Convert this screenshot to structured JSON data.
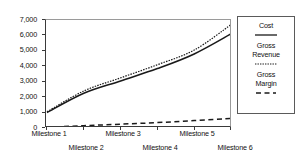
{
  "chart_data": {
    "type": "line",
    "title": "",
    "xlabel": "",
    "ylabel": "",
    "categories": [
      "Milestone 1",
      "Milestone 2",
      "Milestone 3",
      "Milestone 4",
      "Milestone 5",
      "Milestone 6"
    ],
    "x": [
      1,
      2,
      3,
      4,
      5,
      6
    ],
    "ylim": [
      0,
      7000
    ],
    "yticks": [
      0,
      1000,
      2000,
      3000,
      4000,
      5000,
      6000,
      7000
    ],
    "ytick_labels": [
      "0",
      "1,000",
      "2,000",
      "3,000",
      "4,000",
      "5,000",
      "6,000",
      "7,000"
    ],
    "grid": false,
    "legend_position": "right",
    "series": [
      {
        "name": "Cost",
        "style": "solid",
        "color": "#1a1a1a",
        "values": [
          1000,
          2250,
          3050,
          3850,
          4800,
          6100
        ]
      },
      {
        "name": "Gross Revenue",
        "style": "dotted",
        "color": "#1a1a1a",
        "values": [
          1050,
          2400,
          3250,
          4100,
          5050,
          6700
        ]
      },
      {
        "name": "Gross Margin",
        "style": "dashed",
        "color": "#1a1a1a",
        "values": [
          50,
          150,
          250,
          350,
          480,
          620
        ]
      }
    ]
  },
  "legend": {
    "entries": [
      {
        "label_line1": "Cost",
        "label_line2": "",
        "style": "solid"
      },
      {
        "label_line1": "Gross",
        "label_line2": "Revenue",
        "style": "dotted"
      },
      {
        "label_line1": "Gross",
        "label_line2": "Margin",
        "style": "dashed"
      }
    ]
  },
  "axis": {
    "y_labels": [
      "7,000",
      "6,000",
      "5,000",
      "4,000",
      "3,000",
      "2,000",
      "1,000",
      "0"
    ],
    "x_labels_row_a": [
      "Milestone 1",
      "Milestone 3",
      "Milestone 5"
    ],
    "x_labels_row_b": [
      "Milestone 2",
      "Milestone 4",
      "Milestone 6"
    ]
  },
  "colors": {
    "line": "#1a1a1a",
    "axis": "#3a3a3a",
    "frame": "#9a9a9a",
    "background": "#ffffff"
  }
}
